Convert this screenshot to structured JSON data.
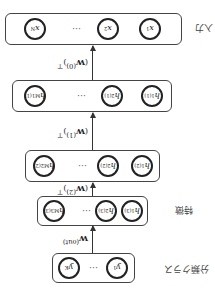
{
  "orientation": "rotated 180 degrees",
  "layers": [
    {
      "label": "入力",
      "nodes": [
        "x",
        "x",
        "x"
      ],
      "subs": [
        "1",
        "2",
        "N"
      ],
      "sups": [
        "",
        "",
        ""
      ],
      "ellipsis": "…"
    },
    {
      "label": "",
      "nodes": [
        "h",
        "h",
        "h"
      ],
      "subs": [
        "1",
        "2",
        "M1"
      ],
      "sups": [
        "(1)",
        "(1)",
        "(1)"
      ],
      "ellipsis": "…"
    },
    {
      "label": "",
      "nodes": [
        "h",
        "h",
        "h"
      ],
      "subs": [
        "1",
        "2",
        "M2"
      ],
      "sups": [
        "(2)",
        "(2)",
        "(2)"
      ],
      "ellipsis": "…"
    },
    {
      "label": "特徴",
      "nodes": [
        "h",
        "h",
        "h"
      ],
      "subs": [
        "1",
        "2",
        "M3"
      ],
      "sups": [
        "(3)",
        "(3)",
        "(3)"
      ],
      "ellipsis": "…"
    },
    {
      "label": "分類クラス",
      "nodes": [
        "y",
        "y"
      ],
      "subs": [
        "1",
        "K"
      ],
      "sups": [
        "",
        ""
      ],
      "ellipsis": "…"
    }
  ],
  "weights": [
    {
      "base": "W",
      "sup": "(0)",
      "transpose": "⊤"
    },
    {
      "base": "W",
      "sup": "(1)",
      "transpose": "⊤"
    },
    {
      "base": "W",
      "sup": "(2)",
      "transpose": "⊤"
    },
    {
      "base": "W",
      "sup": "(out)",
      "transpose": ""
    }
  ]
}
